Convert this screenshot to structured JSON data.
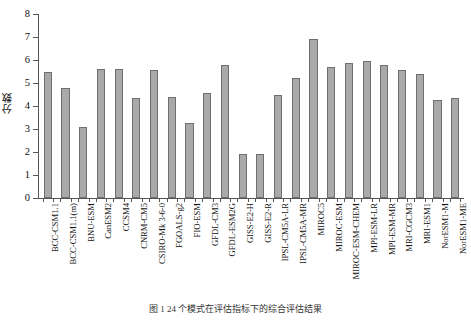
{
  "chart_data": {
    "type": "bar",
    "title": "",
    "xlabel": "",
    "ylabel": "分数",
    "ylim": [
      0,
      8
    ],
    "yticks": [
      0,
      1,
      2,
      3,
      4,
      5,
      6,
      7,
      8
    ],
    "grid": false,
    "legend": null,
    "bar_color": "#a9a9a9",
    "bar_edge_color": "#6f6f6f",
    "axis_color": "#555555",
    "categories": [
      "BCC-CSM1.1",
      "BCC-CSM1.1(m)",
      "BNU-ESM",
      "CanESM2",
      "CCSM4",
      "CNRM-CM5",
      "CSIRO-Mk 3-6-0",
      "FGOALS-g2",
      "FIO-ESM",
      "GFDL-CM3",
      "GFDL-ESM2G",
      "GISS-E2-H",
      "GISS-E2-R",
      "IPSL-CM5A-LR",
      "IPSL-CM5A-MR",
      "MIROC5",
      "MIROC-ESM",
      "MIROC-ESM-CHEM",
      "MPI-ESM-LR",
      "MPI-ESM-MR",
      "MRI-CGCM3",
      "MRI-ESM1",
      "NorESM1-M",
      "NorESM1-ME"
    ],
    "values": [
      5.5,
      4.8,
      3.1,
      5.6,
      5.6,
      4.35,
      5.55,
      4.4,
      3.25,
      4.55,
      5.8,
      1.9,
      1.9,
      4.5,
      5.2,
      6.9,
      5.7,
      5.85,
      5.95,
      5.8,
      5.55,
      5.4,
      4.25,
      4.35
    ]
  },
  "caption": {
    "text": "图 1  24 个模式在评估指标下的综合评估结果"
  }
}
